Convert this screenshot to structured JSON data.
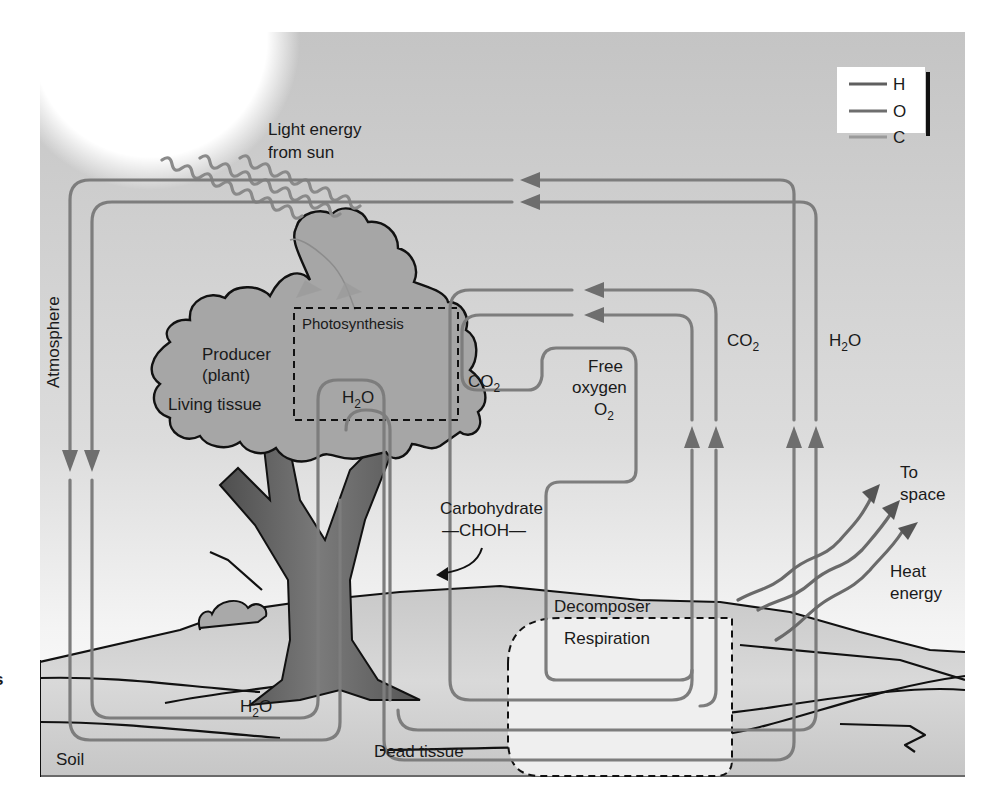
{
  "diagram": {
    "legend": {
      "items": [
        {
          "symbol": "H",
          "line_color": "#5f5f5f"
        },
        {
          "symbol": "O",
          "line_color": "#6e6e6e"
        },
        {
          "symbol": "C",
          "line_color": "#9a9a9a"
        }
      ]
    },
    "labels": {
      "light_energy_line1": "Light energy",
      "light_energy_line2": "from sun",
      "atmosphere": "Atmosphere",
      "photosynthesis": "Photosynthesis",
      "producer_line1": "Producer",
      "producer_line2": "(plant)",
      "living_tissue": "Living tissue",
      "h2o_canopy": "H",
      "h2o_canopy_sub": "2",
      "h2o_canopy_tail": "O",
      "co2_canopy": "CO",
      "co2_canopy_sub": "2",
      "free_oxygen_line1": "Free",
      "free_oxygen_line2": "oxygen",
      "free_oxygen_line3": "O",
      "free_oxygen_line3_sub": "2",
      "co2_right": "CO",
      "co2_right_sub": "2",
      "h2o_right": "H",
      "h2o_right_sub": "2",
      "h2o_right_tail": "O",
      "carbohydrate": "Carbohydrate",
      "choh": "—CHOH—",
      "to_space_line1": "To",
      "to_space_line2": "space",
      "heat_energy_line1": "Heat",
      "heat_energy_line2": "energy",
      "decomposer": "Decomposer",
      "respiration": "Respiration",
      "h2o_roots": "H",
      "h2o_roots_sub": "2",
      "h2o_roots_tail": "O",
      "soil": "Soil",
      "dead_tissue": "Dead tissue",
      "margin_fragment": "s"
    },
    "colors": {
      "panel_bg": "#c9c9c9",
      "sky_light": "#e9e9e9",
      "sun": "#ffffff",
      "foliage": "#a4a4a4",
      "trunk": "#6b6b6b",
      "ground": "#bdbdbd",
      "decomposer_zone": "#efefef"
    }
  }
}
